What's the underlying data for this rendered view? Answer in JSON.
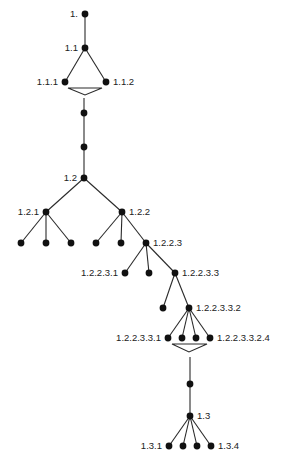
{
  "diagram": {
    "type": "tree",
    "colors": {
      "edge": "#2a2a2a",
      "node": "#111111",
      "label": "#222222",
      "background": "#ffffff"
    },
    "nodes": [
      {
        "id": "n1",
        "x": 85,
        "y": 14,
        "label": "1.",
        "label_side": "left"
      },
      {
        "id": "n1_1",
        "x": 85,
        "y": 48,
        "label": "1.1",
        "label_side": "left"
      },
      {
        "id": "n1_1_1",
        "x": 65,
        "y": 82,
        "label": "1.1.1",
        "label_side": "left"
      },
      {
        "id": "n1_1_2",
        "x": 106,
        "y": 82,
        "label": "1.1.2",
        "label_side": "right"
      },
      {
        "id": "c1",
        "x": 84,
        "y": 113,
        "label": "",
        "label_side": "none"
      },
      {
        "id": "c2",
        "x": 84,
        "y": 147,
        "label": "",
        "label_side": "none"
      },
      {
        "id": "n1_2",
        "x": 84,
        "y": 178,
        "label": "1.2",
        "label_side": "left"
      },
      {
        "id": "n1_2_1",
        "x": 46,
        "y": 212,
        "label": "1.2.1",
        "label_side": "left"
      },
      {
        "id": "n1_2_2",
        "x": 122,
        "y": 212,
        "label": "1.2.2",
        "label_side": "right"
      },
      {
        "id": "l121a",
        "x": 21,
        "y": 243,
        "label": "",
        "label_side": "none"
      },
      {
        "id": "l121b",
        "x": 46,
        "y": 243,
        "label": "",
        "label_side": "none"
      },
      {
        "id": "l121c",
        "x": 71,
        "y": 243,
        "label": "",
        "label_side": "none"
      },
      {
        "id": "l122a",
        "x": 96,
        "y": 243,
        "label": "",
        "label_side": "none"
      },
      {
        "id": "l122b",
        "x": 121,
        "y": 243,
        "label": "",
        "label_side": "none"
      },
      {
        "id": "n1_2_2_3",
        "x": 146,
        "y": 243,
        "label": "1.2.2.3",
        "label_side": "right"
      },
      {
        "id": "n1_2_2_3_1",
        "x": 125,
        "y": 273,
        "label": "1.2.2.3.1",
        "label_side": "left"
      },
      {
        "id": "l1223b",
        "x": 149,
        "y": 273,
        "label": "",
        "label_side": "none"
      },
      {
        "id": "n1_2_2_3_3",
        "x": 175,
        "y": 273,
        "label": "1.2.2.3.3",
        "label_side": "right"
      },
      {
        "id": "l12233a",
        "x": 163,
        "y": 308,
        "label": "",
        "label_side": "none"
      },
      {
        "id": "n1_2_2_3_3_2",
        "x": 189,
        "y": 308,
        "label": "1.2.2.3.3.2",
        "label_side": "right"
      },
      {
        "id": "k1",
        "x": 168,
        "y": 338,
        "label": "1.2.2.3.3.1",
        "label_side": "left"
      },
      {
        "id": "k2",
        "x": 182,
        "y": 338,
        "label": "",
        "label_side": "none"
      },
      {
        "id": "k3",
        "x": 196,
        "y": 338,
        "label": "",
        "label_side": "none"
      },
      {
        "id": "k4",
        "x": 210,
        "y": 338,
        "label": "1.2.2.3.3.2.4",
        "label_side": "right"
      },
      {
        "id": "c3",
        "x": 190,
        "y": 384,
        "label": "",
        "label_side": "none"
      },
      {
        "id": "n1_3",
        "x": 190,
        "y": 416,
        "label": "1.3",
        "label_side": "right"
      },
      {
        "id": "n1_3_1",
        "x": 169,
        "y": 446,
        "label": "1.3.1",
        "label_side": "left"
      },
      {
        "id": "m2",
        "x": 183,
        "y": 446,
        "label": "",
        "label_side": "none"
      },
      {
        "id": "m3",
        "x": 197,
        "y": 446,
        "label": "",
        "label_side": "none"
      },
      {
        "id": "n1_3_4",
        "x": 211,
        "y": 446,
        "label": "1.3.4",
        "label_side": "right"
      }
    ],
    "edges": [
      [
        "n1",
        "n1_1"
      ],
      [
        "n1_1",
        "n1_1_1"
      ],
      [
        "n1_1",
        "n1_1_2"
      ],
      [
        "n1_2",
        "n1_2_1"
      ],
      [
        "n1_2",
        "n1_2_2"
      ],
      [
        "n1_2_1",
        "l121a"
      ],
      [
        "n1_2_1",
        "l121b"
      ],
      [
        "n1_2_1",
        "l121c"
      ],
      [
        "n1_2_2",
        "l122a"
      ],
      [
        "n1_2_2",
        "l122b"
      ],
      [
        "n1_2_2",
        "n1_2_2_3"
      ],
      [
        "n1_2_2_3",
        "n1_2_2_3_1"
      ],
      [
        "n1_2_2_3",
        "l1223b"
      ],
      [
        "n1_2_2_3",
        "n1_2_2_3_3"
      ],
      [
        "n1_2_2_3_3",
        "l12233a"
      ],
      [
        "n1_2_2_3_3",
        "n1_2_2_3_3_2"
      ],
      [
        "n1_2_2_3_3_2",
        "k1"
      ],
      [
        "n1_2_2_3_3_2",
        "k2"
      ],
      [
        "n1_2_2_3_3_2",
        "k3"
      ],
      [
        "n1_2_2_3_3_2",
        "k4"
      ],
      [
        "n1_3",
        "n1_3_1"
      ],
      [
        "n1_3",
        "m2"
      ],
      [
        "n1_3",
        "m3"
      ],
      [
        "n1_3",
        "n1_3_4"
      ]
    ],
    "segments": [
      {
        "x1": 84,
        "y1": 98,
        "x2": 84,
        "y2": 178
      },
      {
        "x1": 190,
        "y1": 357,
        "x2": 190,
        "y2": 416
      }
    ],
    "funnels": [
      {
        "left": 68,
        "right": 102,
        "top": 88,
        "apex_x": 85,
        "apex_y": 95
      },
      {
        "left": 172,
        "right": 207,
        "top": 344,
        "apex_x": 189,
        "apex_y": 352
      }
    ]
  }
}
